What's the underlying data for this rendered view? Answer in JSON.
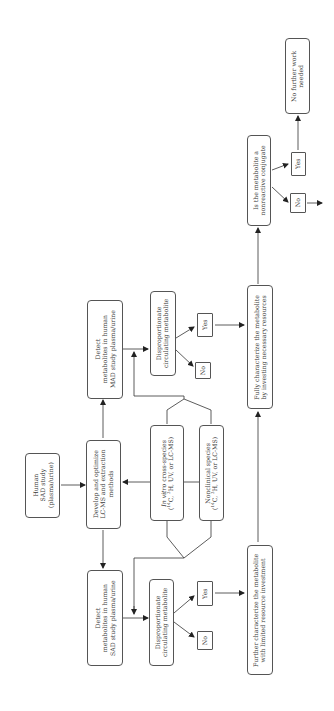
{
  "diagram": {
    "orientation": "rotated-90-ccw",
    "nodes": {
      "human_sad": {
        "lines": [
          "Human",
          "SAD study",
          "(plasma/urine)"
        ]
      },
      "develop": {
        "lines": [
          "Develop and optimize",
          "LC-MS and extraction",
          "methods"
        ]
      },
      "detect_mad": {
        "lines": [
          "Detect",
          "metabolites in human",
          "MAD study plasma/urine"
        ]
      },
      "detect_sad": {
        "lines": [
          "Detect",
          "metabolites in human",
          "SAD study plasma/urine"
        ]
      },
      "in_vitro": {
        "italic": "In vitro",
        "rest": " cross-species",
        "line2": "(14C, 3H, UV, or LC-MS)"
      },
      "nonclinical": {
        "line1": "Nonclinical species",
        "line2": "(14C, 3H, UV, or LC-MS)"
      },
      "disp_top": {
        "lines": [
          "Disproportionate",
          "circulating metabolite"
        ]
      },
      "disp_bottom": {
        "lines": [
          "Disproportionate",
          "circulating metabolite"
        ]
      },
      "yes_top": {
        "label": "Yes"
      },
      "no_top": {
        "label": "No"
      },
      "yes_bottom": {
        "label": "Yes"
      },
      "no_bottom": {
        "label": "No"
      },
      "fully": {
        "lines": [
          "Fully characterize the metabolite",
          "by investing necessary resources"
        ]
      },
      "further": {
        "lines": [
          "Further characterize the metabolite",
          "with limited resource investment"
        ]
      },
      "conjugate": {
        "lines": [
          "Is the metabolite a",
          "nonreactive conjugate"
        ]
      },
      "yes_conj": {
        "label": "Yes"
      },
      "no_conj": {
        "label": "No"
      },
      "no_further": {
        "lines": [
          "No further work",
          "needed"
        ]
      }
    },
    "colors": {
      "line": "#333333",
      "border": "#555555",
      "text": "#3a3a3a",
      "background": "#ffffff"
    }
  }
}
